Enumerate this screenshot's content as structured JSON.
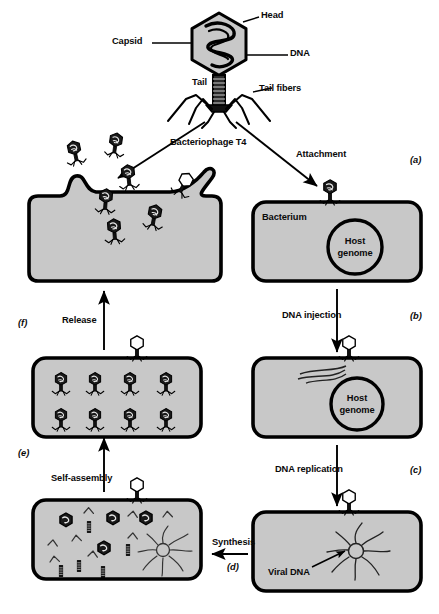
{
  "figure": {
    "virus_name": "Bacteriophage T4",
    "background_color": "#ffffff",
    "cell_fill_color": "#c8c8c8",
    "outline_color": "#000000"
  },
  "anatomy": {
    "head": "Head",
    "capsid": "Capsid",
    "dna": "DNA",
    "tail": "Tail",
    "tail_fibers": "Tail fibers"
  },
  "stages": [
    {
      "id": "(a)",
      "label": "Attachment",
      "cell_label": "Bacterium",
      "genome_label_line1": "Host",
      "genome_label_line2": "genome"
    },
    {
      "id": "(b)",
      "label": "DNA injection",
      "genome_label_line1": "Host",
      "genome_label_line2": "genome"
    },
    {
      "id": "(c)",
      "label": "DNA replication",
      "contents_label": "Viral DNA"
    },
    {
      "id": "(d)",
      "label": "Synthesis"
    },
    {
      "id": "(e)",
      "label": "Self-assembly"
    },
    {
      "id": "(f)",
      "label": "Release"
    }
  ],
  "counts": {
    "assembled_phages_in_cell": 8,
    "free_phages_released": 6,
    "phage_parts_heads": 4
  }
}
